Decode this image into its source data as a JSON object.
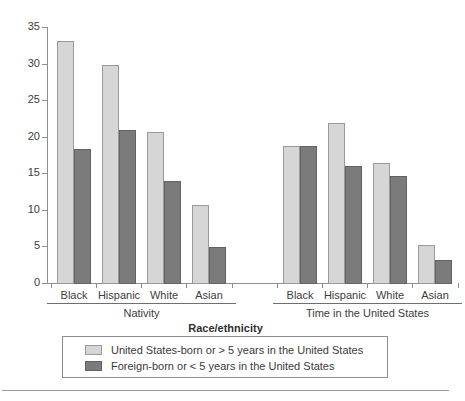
{
  "chart_data": {
    "type": "bar",
    "title": "",
    "xlabel": "Race/ethnicity",
    "ylabel": "",
    "ylim": [
      0,
      35
    ],
    "ytick_values": [
      0,
      5,
      10,
      15,
      20,
      25,
      30,
      35
    ],
    "ytick_labels": [
      "0",
      "5",
      "10",
      "15",
      "20",
      "25",
      "30",
      "35"
    ],
    "grid": false,
    "legend_position": "bottom",
    "group_labels": [
      "Nativity",
      "Time in the United States"
    ],
    "categories": [
      "Black",
      "Hispanic",
      "White",
      "Asian"
    ],
    "series": [
      {
        "name": "United States-born or > 5 years in the United States",
        "color": "#d6d6d6",
        "values_nativity": [
          33.2,
          29.9,
          20.8,
          10.8
        ],
        "values_time_in_us": [
          18.9,
          22.0,
          16.5,
          5.3
        ]
      },
      {
        "name": "Foreign-born or < 5 years in the United States",
        "color": "#7b7b7b",
        "values_nativity": [
          18.5,
          21.0,
          14.1,
          5.0
        ],
        "values_time_in_us": [
          18.9,
          16.1,
          14.8,
          3.3
        ]
      }
    ]
  },
  "axis": {
    "x_title": "Race/ethnicity",
    "y_ticks": [
      "35",
      "30",
      "25",
      "20",
      "15",
      "10",
      "5",
      "0"
    ]
  },
  "groups": [
    {
      "name": "Nativity",
      "categories": [
        {
          "label": "Black",
          "light": 33.2,
          "dark": 18.5
        },
        {
          "label": "Hispanic",
          "light": 29.9,
          "dark": 21.0
        },
        {
          "label": "White",
          "light": 20.8,
          "dark": 14.1
        },
        {
          "label": "Asian",
          "light": 10.8,
          "dark": 5.0
        }
      ]
    },
    {
      "name": "Time in the United States",
      "categories": [
        {
          "label": "Black",
          "light": 18.9,
          "dark": 18.9
        },
        {
          "label": "Hispanic",
          "light": 22.0,
          "dark": 16.1
        },
        {
          "label": "White",
          "light": 16.5,
          "dark": 14.8
        },
        {
          "label": "Asian",
          "light": 5.3,
          "dark": 3.3
        }
      ]
    }
  ],
  "legend": {
    "items": [
      {
        "label": "United States-born or > 5 years in the United States",
        "swatch": "light"
      },
      {
        "label": "Foreign-born or < 5 years in the United States",
        "swatch": "dark"
      }
    ]
  },
  "colors": {
    "light_bar": "#d6d6d6",
    "dark_bar": "#7b7b7b",
    "axis": "#8e8e8e",
    "text": "#3a3a3a",
    "background": "#ffffff"
  }
}
